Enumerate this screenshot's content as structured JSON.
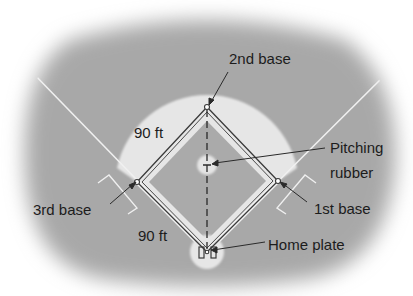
{
  "diagram": {
    "type": "baseball-diamond",
    "labels": {
      "second_base": "2nd base",
      "third_base": "3rd base",
      "first_base": "1st base",
      "home_plate": "Home plate",
      "pitching_line1": "Pitching",
      "pitching_line2": "rubber",
      "side_upper_left": "90 ft",
      "side_lower_left": "90 ft"
    },
    "points": {
      "second_base": [
        207,
        107
      ],
      "third_base": [
        137,
        182
      ],
      "first_base": [
        278,
        181
      ],
      "home_plate": [
        207,
        252
      ],
      "pitching_rubber": [
        207,
        165
      ]
    },
    "colors": {
      "outfield": "#a9a9a9",
      "infield_dirt": "#e6e6e6",
      "infield_grass": "#aaaaaa",
      "lines": "#3a3a3a",
      "chalk": "#f2f2f2",
      "text": "#1c1c1c"
    }
  }
}
